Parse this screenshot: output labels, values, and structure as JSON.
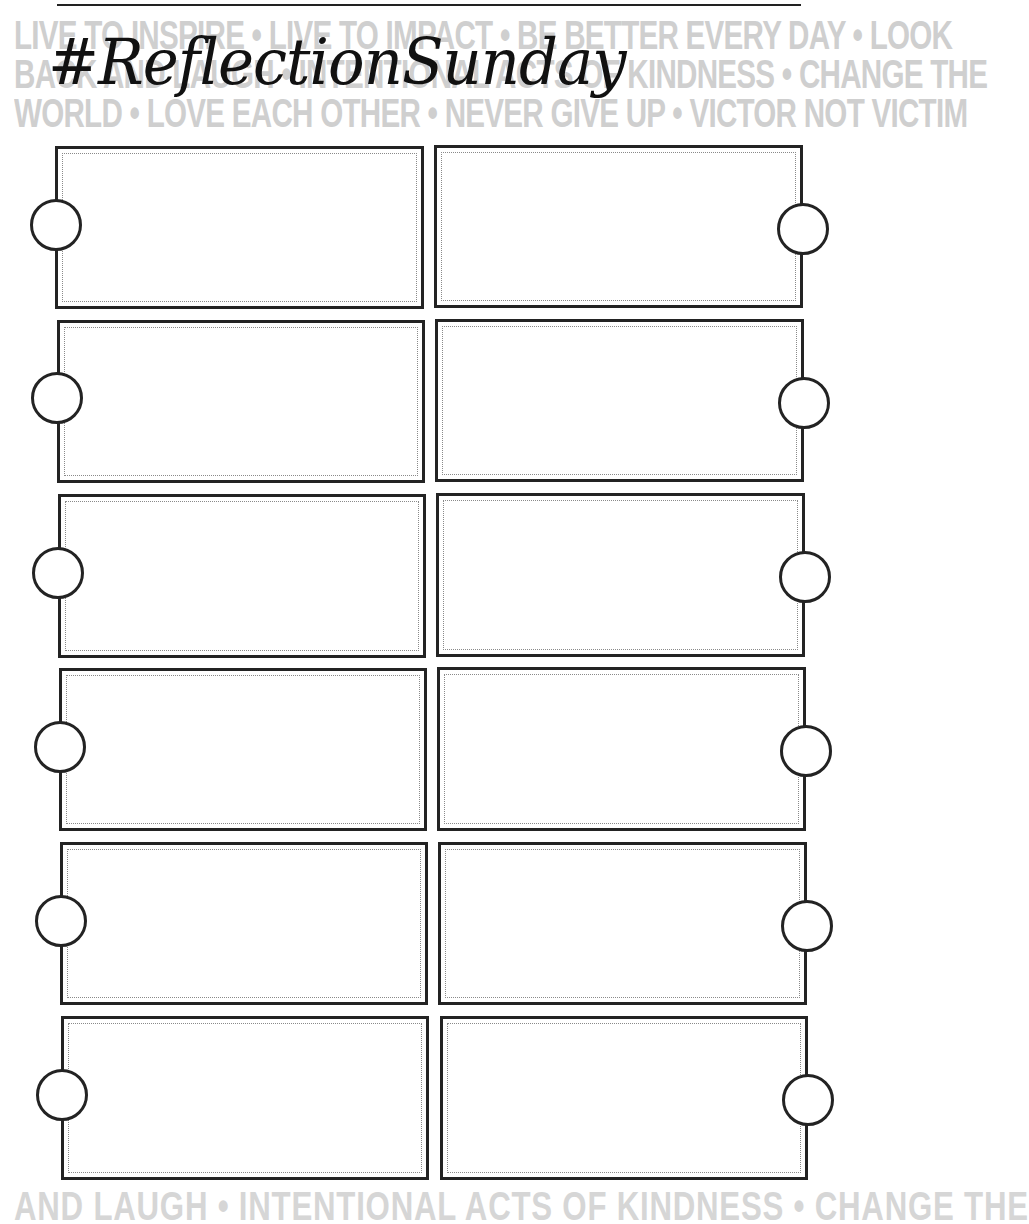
{
  "page": {
    "title": "#ReflectionSunday",
    "background_quote_lines": [
      "LIVE TO INSPIRE • LIVE TO IMPACT • BE BETTER EVERY DAY • LOOK",
      "BACK AND LAUGH • INTENTIONAL ACTS OF KINDNESS • CHANGE THE",
      "WORLD • LOVE EACH OTHER • NEVER GIVE UP • VICTOR NOT VICTIM"
    ],
    "background_quote_bottom": "AND LAUGH • INTENTIONAL ACTS OF KINDNESS • CHANGE THE"
  },
  "colors": {
    "ink": "#232323",
    "watermark": "#cfcfcf",
    "dotted_inner": "#8a8a8a",
    "paper": "#ffffff"
  },
  "grid": {
    "rows": 6,
    "columns": 2,
    "left_column": [
      {
        "x": 55,
        "y": 146,
        "w": 369,
        "h": 163,
        "ring_cx": 56,
        "ring_cy": 225,
        "text": ""
      },
      {
        "x": 57,
        "y": 320,
        "w": 368,
        "h": 163,
        "ring_cx": 57,
        "ring_cy": 398,
        "text": ""
      },
      {
        "x": 58,
        "y": 494,
        "w": 368,
        "h": 164,
        "ring_cx": 58,
        "ring_cy": 573,
        "text": ""
      },
      {
        "x": 59,
        "y": 668,
        "w": 368,
        "h": 163,
        "ring_cx": 60,
        "ring_cy": 747,
        "text": ""
      },
      {
        "x": 60,
        "y": 842,
        "w": 368,
        "h": 163,
        "ring_cx": 61,
        "ring_cy": 921,
        "text": ""
      },
      {
        "x": 61,
        "y": 1016,
        "w": 368,
        "h": 164,
        "ring_cx": 62,
        "ring_cy": 1095,
        "text": ""
      }
    ],
    "right_column": [
      {
        "x": 434,
        "y": 145,
        "w": 369,
        "h": 163,
        "ring_cx": 803,
        "ring_cy": 229,
        "text": ""
      },
      {
        "x": 435,
        "y": 319,
        "w": 369,
        "h": 163,
        "ring_cx": 804,
        "ring_cy": 403,
        "text": ""
      },
      {
        "x": 436,
        "y": 493,
        "w": 369,
        "h": 164,
        "ring_cx": 805,
        "ring_cy": 577,
        "text": ""
      },
      {
        "x": 437,
        "y": 667,
        "w": 369,
        "h": 164,
        "ring_cx": 806,
        "ring_cy": 751,
        "text": ""
      },
      {
        "x": 438,
        "y": 842,
        "w": 369,
        "h": 163,
        "ring_cx": 807,
        "ring_cy": 926,
        "text": ""
      },
      {
        "x": 440,
        "y": 1016,
        "w": 368,
        "h": 164,
        "ring_cx": 808,
        "ring_cy": 1100,
        "text": ""
      }
    ]
  }
}
